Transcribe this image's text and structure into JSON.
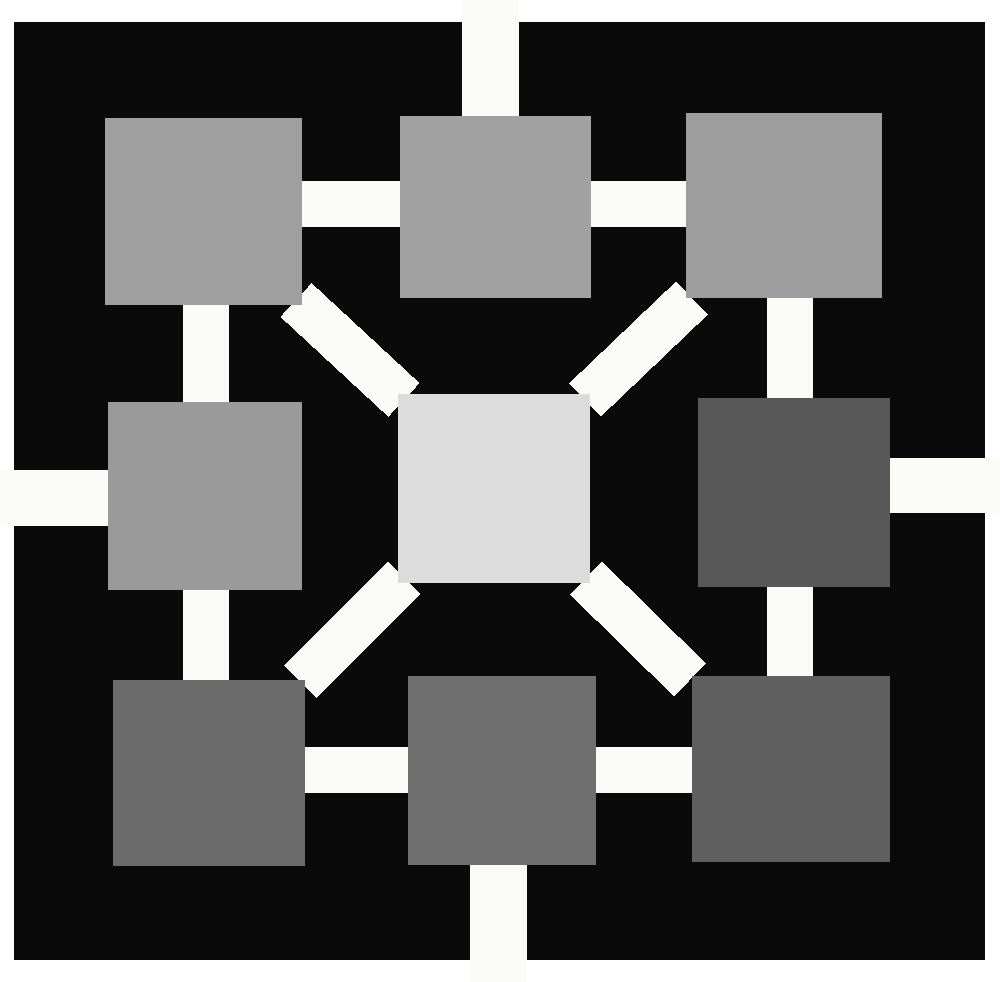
{
  "figure": {
    "width": 1000,
    "height": 982,
    "page_background": "#ffffff",
    "canvas_background": "#0a0a0a",
    "edge_color": "#fbfbf8"
  },
  "canvas": {
    "x": 14,
    "y": 22,
    "width": 971,
    "height": 938
  },
  "nodes": [
    {
      "id": "n-top-left",
      "label": "top-left node",
      "x": 105,
      "y": 118,
      "width": 197,
      "height": 187,
      "color": "#9f9f9f"
    },
    {
      "id": "n-top-center",
      "label": "top-center node",
      "x": 400,
      "y": 116,
      "width": 191,
      "height": 182,
      "color": "#a1a1a1"
    },
    {
      "id": "n-top-right",
      "label": "top-right node",
      "x": 686,
      "y": 113,
      "width": 196,
      "height": 185,
      "color": "#9d9d9d"
    },
    {
      "id": "n-middle-left",
      "label": "middle-left node",
      "x": 108,
      "y": 402,
      "width": 194,
      "height": 188,
      "color": "#9a9a9a"
    },
    {
      "id": "n-center",
      "label": "center node",
      "x": 398,
      "y": 394,
      "width": 192,
      "height": 189,
      "color": "#dcdcdc"
    },
    {
      "id": "n-middle-right",
      "label": "middle-right node",
      "x": 698,
      "y": 398,
      "width": 192,
      "height": 189,
      "color": "#585858"
    },
    {
      "id": "n-bottom-left",
      "label": "bottom-left node",
      "x": 113,
      "y": 680,
      "width": 192,
      "height": 186,
      "color": "#6b6b6b"
    },
    {
      "id": "n-bottom-center",
      "label": "bottom-center node",
      "x": 408,
      "y": 676,
      "width": 188,
      "height": 189,
      "color": "#6e6e6e"
    },
    {
      "id": "n-bottom-right",
      "label": "bottom-right node",
      "x": 692,
      "y": 676,
      "width": 198,
      "height": 186,
      "color": "#5f5f5f"
    }
  ],
  "edges": [
    {
      "id": "e-tl-tc",
      "label": "top-left to top-center",
      "kind": "horizontal",
      "x1": 300,
      "y1": 204,
      "x2": 402,
      "y2": 204,
      "thickness": 46
    },
    {
      "id": "e-tc-tr",
      "label": "top-center to top-right",
      "kind": "horizontal",
      "x1": 589,
      "y1": 204,
      "x2": 688,
      "y2": 204,
      "thickness": 46
    },
    {
      "id": "e-ml-bl",
      "label": "middle-left to bottom-left",
      "kind": "vertical",
      "x1": 206,
      "y1": 588,
      "x2": 206,
      "y2": 682,
      "thickness": 46
    },
    {
      "id": "e-tl-ml",
      "label": "top-left to middle-left",
      "kind": "vertical",
      "x1": 206,
      "y1": 303,
      "x2": 206,
      "y2": 404,
      "thickness": 46
    },
    {
      "id": "e-tr-mr",
      "label": "top-right to middle-right",
      "kind": "vertical",
      "x1": 790,
      "y1": 296,
      "x2": 790,
      "y2": 400,
      "thickness": 46
    },
    {
      "id": "e-mr-br",
      "label": "middle-right to bottom-right",
      "kind": "vertical",
      "x1": 790,
      "y1": 585,
      "x2": 790,
      "y2": 678,
      "thickness": 46
    },
    {
      "id": "e-bl-bc",
      "label": "bottom-left to bottom-center",
      "kind": "horizontal",
      "x1": 303,
      "y1": 770,
      "x2": 410,
      "y2": 770,
      "thickness": 46
    },
    {
      "id": "e-bc-br",
      "label": "bottom-center to bottom-right",
      "kind": "horizontal",
      "x1": 594,
      "y1": 770,
      "x2": 694,
      "y2": 770,
      "thickness": 46
    },
    {
      "id": "e-tl-c",
      "label": "top-left to center (diagonal)",
      "kind": "diagonal",
      "x1": 296,
      "y1": 300,
      "x2": 404,
      "y2": 400,
      "thickness": 46
    },
    {
      "id": "e-tr-c",
      "label": "top-right to center (diagonal)",
      "kind": "diagonal",
      "x1": 692,
      "y1": 298,
      "x2": 585,
      "y2": 400,
      "thickness": 46
    },
    {
      "id": "e-bl-c",
      "label": "bottom-left to center (diagonal)",
      "kind": "diagonal",
      "x1": 300,
      "y1": 682,
      "x2": 404,
      "y2": 578,
      "thickness": 46
    },
    {
      "id": "e-br-c",
      "label": "bottom-right to center (diagonal)",
      "kind": "diagonal",
      "x1": 690,
      "y1": 680,
      "x2": 586,
      "y2": 578,
      "thickness": 46
    }
  ],
  "border_stubs": [
    {
      "id": "s-top",
      "label": "top border connector",
      "x": 462,
      "y": 0,
      "width": 57,
      "height": 120,
      "orientation": "vertical"
    },
    {
      "id": "s-left",
      "label": "left border connector",
      "x": 0,
      "y": 470,
      "width": 115,
      "height": 56,
      "orientation": "horizontal"
    },
    {
      "id": "s-right",
      "label": "right border connector",
      "x": 885,
      "y": 458,
      "width": 115,
      "height": 55,
      "orientation": "horizontal"
    },
    {
      "id": "s-bottom",
      "label": "bottom border connector",
      "x": 470,
      "y": 860,
      "width": 57,
      "height": 122,
      "orientation": "vertical"
    }
  ],
  "legend": {
    "node_count": 9,
    "edge_count": 12,
    "layout": "3x3 grid with central hub",
    "shades": [
      "#9f9f9f",
      "#a1a1a1",
      "#9d9d9d",
      "#9a9a9a",
      "#dcdcdc",
      "#585858",
      "#6b6b6b",
      "#6e6e6e",
      "#5f5f5f"
    ]
  }
}
